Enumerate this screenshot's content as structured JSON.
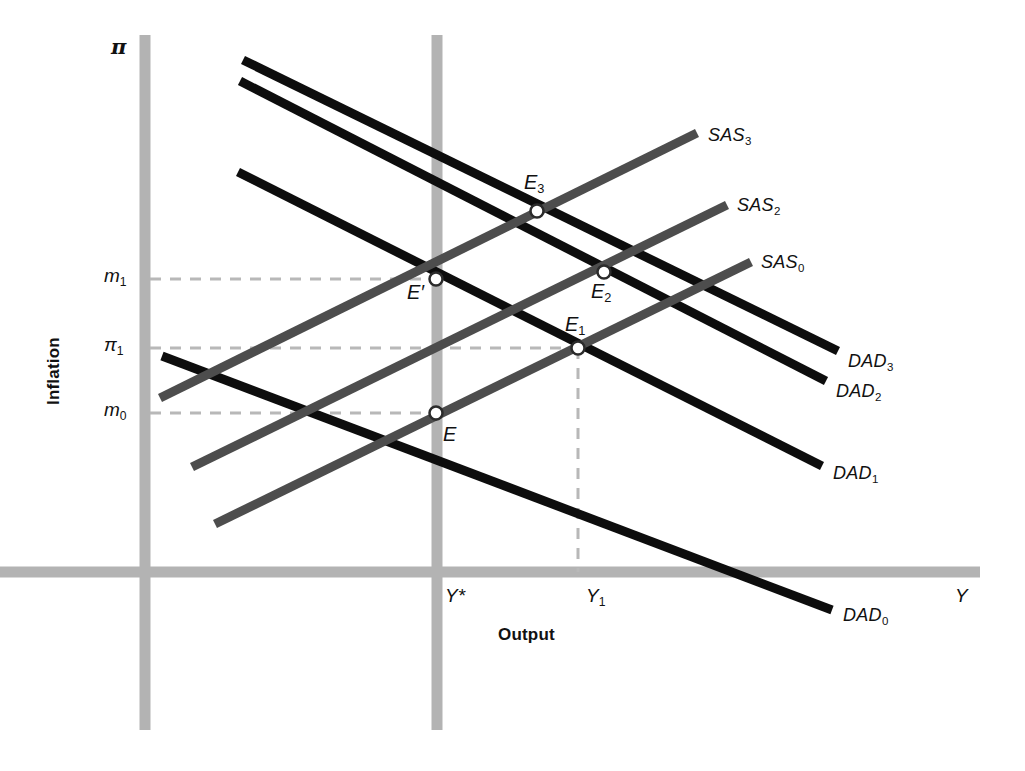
{
  "figure": {
    "background": "#ffffff",
    "width": 1025,
    "height": 771
  },
  "colors": {
    "axis_gray": "#b3b3b3",
    "grid_gray": "#c0c0c0",
    "dad_black": "#0d0d0d",
    "sas_gray": "#4d4d4d",
    "dash_gray": "#b8b8b8",
    "point_fill": "#ffffff",
    "text": "#111111"
  },
  "axes": {
    "y_axis_label_symbol": "π",
    "y_axis_name": "Inflation",
    "x_axis_label_symbol": "Y",
    "x_axis_name": "Output",
    "y_ticks": [
      {
        "id": "m1",
        "base": "m",
        "sub": "1",
        "y": 279
      },
      {
        "id": "pi1",
        "base": "π",
        "sub": "1",
        "y": 348
      },
      {
        "id": "m0",
        "base": "m",
        "sub": "0",
        "y": 413
      }
    ],
    "x_ticks": [
      {
        "id": "Ystar",
        "base": "Y",
        "sup": "*",
        "x": 437
      },
      {
        "id": "Y1",
        "base": "Y",
        "sub": "1",
        "x": 578
      }
    ]
  },
  "curves": [
    {
      "id": "DAD3",
      "base": "DAD",
      "sub": "3",
      "kind": "dad",
      "label_x": 848,
      "label_y": 352,
      "x1": 243,
      "y1": 60,
      "x2": 838,
      "y2": 351
    },
    {
      "id": "DAD2",
      "base": "DAD",
      "sub": "2",
      "kind": "dad",
      "label_x": 836,
      "label_y": 382,
      "x1": 240,
      "y1": 81,
      "x2": 826,
      "y2": 381
    },
    {
      "id": "DAD1",
      "base": "DAD",
      "sub": "1",
      "kind": "dad",
      "label_x": 833,
      "label_y": 464,
      "x1": 238,
      "y1": 172,
      "x2": 822,
      "y2": 466
    },
    {
      "id": "DAD0",
      "base": "DAD",
      "sub": "0",
      "kind": "dad",
      "label_x": 843,
      "label_y": 606,
      "x1": 162,
      "y1": 356,
      "x2": 832,
      "y2": 610
    },
    {
      "id": "SAS3",
      "base": "SAS",
      "sub": "3",
      "kind": "sas",
      "label_x": 708,
      "label_y": 126,
      "x1": 160,
      "y1": 398,
      "x2": 697,
      "y2": 133
    },
    {
      "id": "SAS2",
      "base": "SAS",
      "sub": "2",
      "kind": "sas",
      "label_x": 737,
      "label_y": 196,
      "x1": 192,
      "y1": 467,
      "x2": 727,
      "y2": 205
    },
    {
      "id": "SAS0",
      "base": "SAS",
      "sub": "0",
      "kind": "sas",
      "label_x": 761,
      "label_y": 253,
      "x1": 215,
      "y1": 524,
      "x2": 751,
      "y2": 262
    }
  ],
  "points": [
    {
      "id": "E",
      "base": "E",
      "sub": "",
      "x": 436,
      "y": 413,
      "label_x": 443,
      "label_y": 424
    },
    {
      "id": "Eprime",
      "base": "E′",
      "sub": "",
      "x": 436,
      "y": 279,
      "label_x": 407,
      "label_y": 282
    },
    {
      "id": "E1",
      "base": "E",
      "sub": "1",
      "x": 578,
      "y": 348,
      "label_x": 565,
      "label_y": 314
    },
    {
      "id": "E2",
      "base": "E",
      "sub": "2",
      "x": 604,
      "y": 272,
      "label_x": 591,
      "label_y": 281
    },
    {
      "id": "E3",
      "base": "E",
      "sub": "3",
      "x": 537,
      "y": 211,
      "label_x": 524,
      "label_y": 172
    }
  ],
  "guides": [
    {
      "id": "dash-m1",
      "orientation": "horizontal",
      "x1": 150,
      "y1": 279,
      "x2": 436,
      "y2": 279
    },
    {
      "id": "dash-pi1",
      "orientation": "horizontal",
      "x1": 150,
      "y1": 348,
      "x2": 578,
      "y2": 348
    },
    {
      "id": "dash-m0",
      "orientation": "horizontal",
      "x1": 150,
      "y1": 413,
      "x2": 436,
      "y2": 413
    },
    {
      "id": "dash-Y1",
      "orientation": "vertical",
      "x1": 578,
      "y1": 348,
      "x2": 578,
      "y2": 572
    }
  ],
  "gridlines": [
    {
      "id": "y-axis",
      "x1": 145,
      "y1": 35,
      "x2": 145,
      "y2": 730
    },
    {
      "id": "x-axis",
      "x1": 0,
      "y1": 572,
      "x2": 980,
      "y2": 572
    },
    {
      "id": "potential-output-line",
      "x1": 437,
      "y1": 35,
      "x2": 437,
      "y2": 730
    }
  ]
}
